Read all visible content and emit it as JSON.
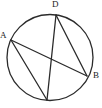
{
  "figure": {
    "type": "circle-with-inscribed-chords",
    "stroke_color": "#2b2b2b",
    "fill_color": "none",
    "background_color": "#ffffff",
    "circle": {
      "center_x": 50,
      "center_y": 57.5,
      "radius": 43,
      "stroke_width": 1.3
    },
    "points": [
      {
        "id": "A",
        "label": "A",
        "x": 11,
        "y": 40
      },
      {
        "id": "D",
        "label": "D",
        "x": 56,
        "y": 15
      },
      {
        "id": "B",
        "label": "B",
        "x": 87,
        "y": 76
      },
      {
        "id": "C",
        "label": "",
        "x": 47,
        "y": 100
      }
    ],
    "chords": [
      {
        "id": "chord-A-B",
        "from": "A",
        "to": "B",
        "x1": 11,
        "y1": 40,
        "x2": 87,
        "y2": 76
      },
      {
        "id": "chord-A-C",
        "from": "A",
        "to": "C",
        "x1": 11,
        "y1": 40,
        "x2": 47,
        "y2": 100
      },
      {
        "id": "chord-D-B",
        "from": "D",
        "to": "B",
        "x1": 56,
        "y1": 15,
        "x2": 87,
        "y2": 76
      },
      {
        "id": "chord-D-C",
        "from": "D",
        "to": "C",
        "x1": 56,
        "y1": 15,
        "x2": 47,
        "y2": 100
      }
    ],
    "labels": {
      "a": "A",
      "d": "D",
      "b": "B",
      "c": ""
    }
  }
}
